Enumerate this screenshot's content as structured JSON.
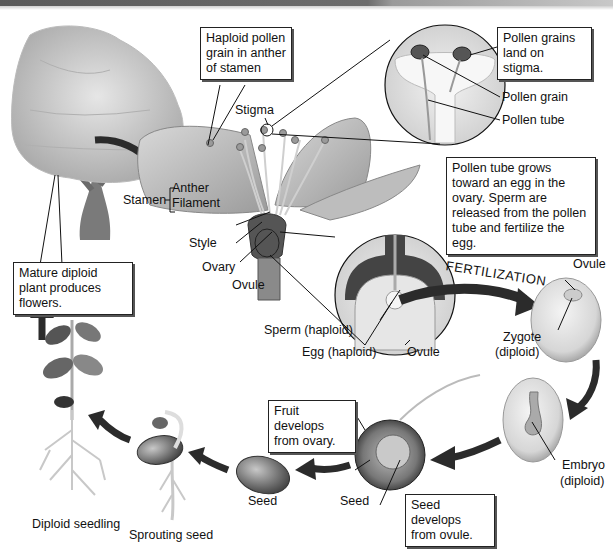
{
  "diagram": {
    "callouts": {
      "haploid_pollen": "Haploid pollen grain in anther of stamen",
      "pollen_land": "Pollen grains land on stigma.",
      "pollen_tube_grows": "Pollen tube grows toward an egg in the ovary. Sperm are released from the pollen tube and fertilize the egg.",
      "mature_plant": "Mature diploid plant produces flowers.",
      "fruit_develops": "Fruit develops from ovary.",
      "seed_develops": "Seed develops from ovule."
    },
    "labels": {
      "stigma": "Stigma",
      "pollen_grain": "Pollen grain",
      "pollen_tube": "Pollen tube",
      "stamen": "Stamen",
      "anther": "Anther",
      "filament": "Filament",
      "style": "Style",
      "ovary": "Ovary",
      "ovule_flower": "Ovule",
      "sperm": "Sperm (haploid)",
      "egg": "Egg (haploid)",
      "ovule_detail": "Ovule",
      "fertilization": "FERTILIZATION",
      "ovule_zygote": "Ovule",
      "zygote": "Zygote",
      "zygote_ploidy": "(diploid)",
      "embryo": "Embryo",
      "embryo_ploidy": "(diploid)",
      "seed_fruit": "Seed",
      "seed": "Seed",
      "sprouting_seed": "Sprouting seed",
      "diploid_seedling": "Diploid seedling"
    },
    "colors": {
      "arrow": "#2b2b2b",
      "line": "#111111",
      "box_border": "#222222"
    }
  }
}
